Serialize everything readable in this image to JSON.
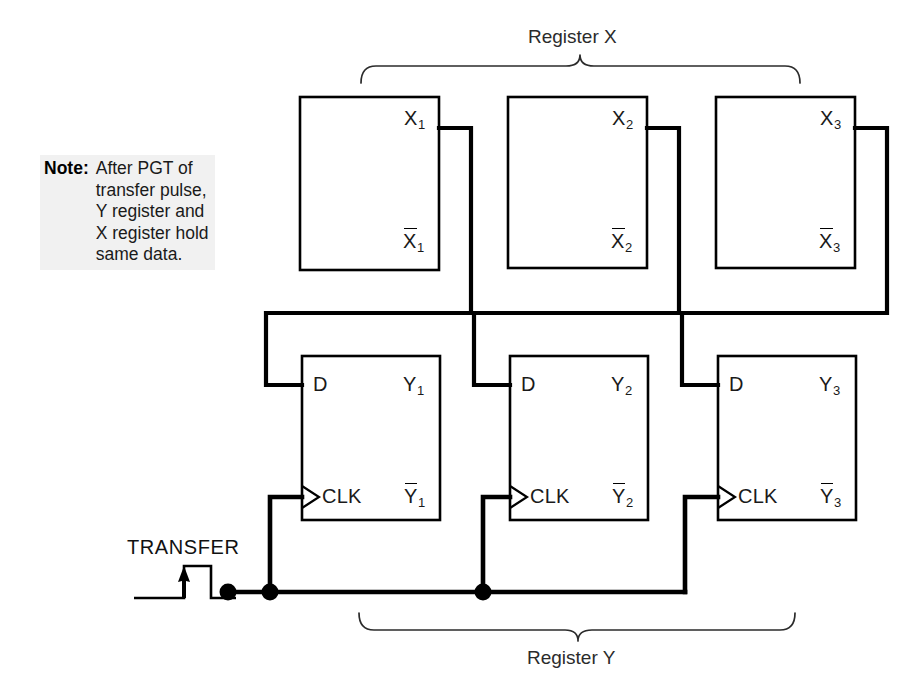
{
  "figure": {
    "kind": "logic-diagram"
  },
  "note": {
    "key": "Note:",
    "lines": [
      "After PGT of",
      "transfer pulse,",
      "Y register and",
      "X register hold",
      "same data."
    ]
  },
  "braces": {
    "register_x_label": "Register X",
    "register_y_label": "Register Y"
  },
  "transfer": {
    "label": "TRANSFER"
  },
  "register_x": {
    "cells": [
      {
        "q": "X",
        "q_sub": "1",
        "qbar": "X",
        "qbar_sub": "1"
      },
      {
        "q": "X",
        "q_sub": "2",
        "qbar": "X",
        "qbar_sub": "2"
      },
      {
        "q": "X",
        "q_sub": "3",
        "qbar": "X",
        "qbar_sub": "3"
      }
    ]
  },
  "register_y": {
    "d_label": "D",
    "clk_label": "CLK",
    "cells": [
      {
        "q": "Y",
        "q_sub": "1",
        "qbar": "Y",
        "qbar_sub": "1"
      },
      {
        "q": "Y",
        "q_sub": "2",
        "qbar": "Y",
        "qbar_sub": "2"
      },
      {
        "q": "Y",
        "q_sub": "3",
        "qbar": "Y",
        "qbar_sub": "3"
      }
    ]
  },
  "colors": {
    "ink": "#000000",
    "wire": "#000000",
    "brace": "#2b2b2b",
    "note_background": "#f1f1f1",
    "page_background": "#ffffff"
  }
}
